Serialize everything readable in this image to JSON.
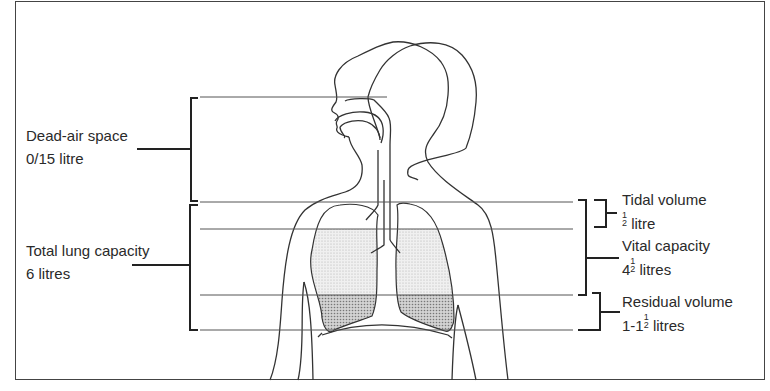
{
  "diagram": {
    "left_labels": {
      "dead_air": {
        "name": "Dead-air space",
        "value": "0/15 litre"
      },
      "total_capacity": {
        "name": "Total lung capacity",
        "value": "6 litres"
      }
    },
    "right_labels": {
      "tidal": {
        "name": "Tidal volume",
        "value_whole": "",
        "value_num": "1",
        "value_den": "2",
        "value_unit": "litre"
      },
      "vital": {
        "name": "Vital capacity",
        "value_whole": "4",
        "value_num": "1",
        "value_den": "2",
        "value_unit": "litres"
      },
      "residual": {
        "name": "Residual volume",
        "value_whole": "1-1",
        "value_num": "1",
        "value_den": "2",
        "value_unit": "litres"
      }
    },
    "colors": {
      "line": "#333333",
      "shading_light": "#e6e6e6",
      "shading_dark": "#b8b8b8",
      "frame": "#444444"
    }
  }
}
